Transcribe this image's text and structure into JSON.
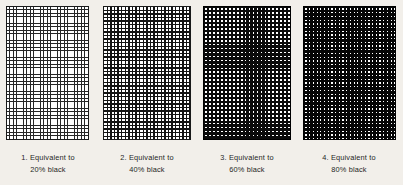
{
  "figure": {
    "type": "halftone-screen-tint-chart",
    "background_color": "#f2efea",
    "ink_color": "#1a1a1a",
    "paper_color": "#ffffff",
    "panel_count": 4
  },
  "panels": [
    {
      "index": "1",
      "number_label": "1.",
      "caption_line1": "1. Equivalent  to",
      "caption_line2": "20%  black",
      "percent_label": "20%",
      "percent_value": 20,
      "descriptor": "Equivalent to",
      "grid_columns": 25,
      "grid_rows": 40,
      "line_weight_px": 0.75,
      "cell_pitch_px": 3.4,
      "appearance": "thin dark grid lines on white, large white cells"
    },
    {
      "index": "2",
      "number_label": "2.",
      "caption_line1": "2. Equivalent  to",
      "caption_line2": "40%  black",
      "percent_label": "40%",
      "percent_value": 40,
      "descriptor": "Equivalent to",
      "grid_columns": 24,
      "grid_rows": 38,
      "line_weight_px": 1.35,
      "cell_pitch_px": 3.6,
      "appearance": "medium black grid lines, white cells slightly smaller than lines"
    },
    {
      "index": "3",
      "number_label": "3.",
      "caption_line1": "3. Equivalent  to",
      "caption_line2": "60%  black",
      "percent_label": "60%",
      "percent_value": 60,
      "descriptor": "Equivalent to",
      "grid_columns": 22,
      "grid_rows": 34,
      "line_weight_px": 2.25,
      "cell_pitch_px": 3.95,
      "appearance": "heavy black grid, small white squares"
    },
    {
      "index": "4",
      "number_label": "4.",
      "caption_line1": "4. Equivalent  to",
      "caption_line2": "80%  black",
      "percent_label": "80%",
      "percent_value": 80,
      "descriptor": "Equivalent to",
      "grid_columns": 25,
      "grid_rows": 37,
      "line_weight_px": 2.45,
      "cell_pitch_px": 3.7,
      "appearance": "near-solid black field with tiny white dots"
    }
  ]
}
